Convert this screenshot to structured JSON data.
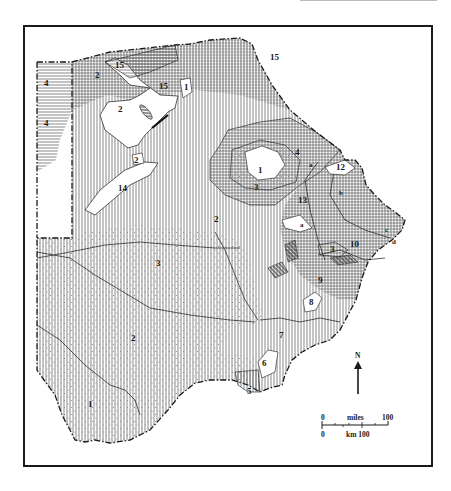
{
  "figure": {
    "type": "thematic zone map",
    "frame": true
  },
  "zones": [
    {
      "id": "1",
      "label": "1",
      "pattern": "plain"
    },
    {
      "id": "2",
      "label": "2",
      "pattern": "mixed"
    },
    {
      "id": "3",
      "label": "3",
      "pattern": "stipple"
    },
    {
      "id": "4",
      "label": "4",
      "pattern": "horizontal-lines"
    },
    {
      "id": "5",
      "label": "5",
      "pattern": "vertical-lines"
    },
    {
      "id": "6",
      "label": "6",
      "pattern": "vertical-lines"
    },
    {
      "id": "7",
      "label": "7",
      "pattern": "vertical-lines"
    },
    {
      "id": "8",
      "label": "8",
      "pattern": "plain"
    },
    {
      "id": "9",
      "label": "9",
      "pattern": "horizontal-lines"
    },
    {
      "id": "10",
      "label": "10",
      "pattern": "horizontal-lines"
    },
    {
      "id": "12",
      "label": "12",
      "pattern": "plain"
    },
    {
      "id": "13",
      "label": "13",
      "pattern": "horizontal-lines"
    },
    {
      "id": "14",
      "label": "14",
      "pattern": "plain"
    },
    {
      "id": "15",
      "label": "15",
      "pattern": "horizontal-lines"
    }
  ],
  "subzones": [
    "a",
    "b",
    "c",
    "d"
  ],
  "labels": {
    "z15_nw": "15",
    "z2_nw": "2",
    "z4_a": "4",
    "z4_b": "4",
    "z2_delta": "2",
    "z15_mid": "15",
    "z1_north": "1",
    "z2_small": "2",
    "z14": "14",
    "z15_ne": "15",
    "z2_center": "2",
    "z1_pan": "1",
    "z3_pan": "3",
    "z4_pan": "4",
    "z13": "13",
    "za1": "a",
    "z12": "12",
    "zb": "b",
    "za2": "a",
    "z10": "10",
    "z3_east": "3",
    "zc": "c",
    "zd": "d",
    "z9": "9",
    "z8": "8",
    "z7": "7",
    "z6": "6",
    "z5": "5",
    "z3_kalahari": "3",
    "z2_south": "2",
    "z1_south": "1"
  },
  "north_arrow": {
    "label": "N"
  },
  "scale_bar": {
    "miles_label": "miles",
    "miles_start": "0",
    "miles_end": "100",
    "km_start": "0",
    "km_label": "km 100"
  },
  "colors": {
    "ink": "#1a1a1a",
    "paper": "#ffffff",
    "hatch": "#555555",
    "dot": "#8a8a8a"
  }
}
